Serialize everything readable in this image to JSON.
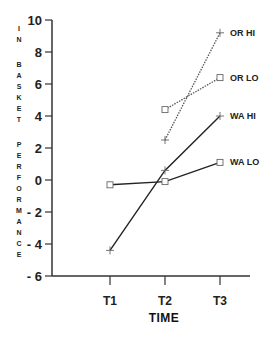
{
  "chart_data": {
    "type": "line",
    "title": "",
    "xlabel": "TIME",
    "ylabel": "IN BASKET PERFORMANCE",
    "categories": [
      "T1",
      "T2",
      "T3"
    ],
    "ylim": [
      -6,
      10
    ],
    "yticks": [
      10,
      8,
      6,
      4,
      2,
      0,
      -2,
      -4,
      -6
    ],
    "ytick_labels": [
      "10",
      "8",
      "6",
      "4",
      "2",
      "0",
      "- 2",
      "- 4",
      "- 6"
    ],
    "grid": false,
    "legend_position": "inline-right",
    "series": [
      {
        "name": "OR HI",
        "values": [
          null,
          2.5,
          9.2
        ],
        "marker": "plus",
        "line": "dotted"
      },
      {
        "name": "OR LO",
        "values": [
          null,
          4.4,
          6.4
        ],
        "marker": "square",
        "line": "dotted"
      },
      {
        "name": "WA HI",
        "values": [
          -4.4,
          0.6,
          4.0
        ],
        "marker": "plus",
        "line": "solid"
      },
      {
        "name": "WA LO",
        "values": [
          -0.3,
          -0.1,
          1.1
        ],
        "marker": "square",
        "line": "solid"
      }
    ]
  }
}
